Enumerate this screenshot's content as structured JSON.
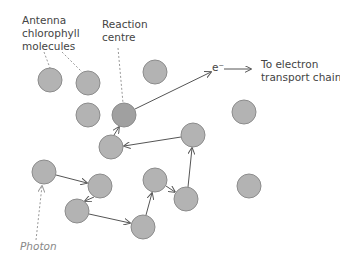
{
  "diagram": {
    "labels": {
      "antenna": "Antenna\nchlorophyll\nmolecules",
      "reaction_centre": "Reaction\ncentre",
      "electron": "e⁻",
      "destination": "To electron\ntransport chain",
      "photon": "Photon"
    },
    "colors": {
      "molecule_fill": "#b3b3b3",
      "reaction_centre_fill": "#a0a0a0",
      "molecule_stroke": "#8c8c8c",
      "arrow": "#555555",
      "dashed": "#999999",
      "text": "#444444"
    },
    "nodes": [
      {
        "id": "a1",
        "x": 50,
        "y": 80,
        "type": "antenna"
      },
      {
        "id": "a2",
        "x": 88,
        "y": 83,
        "type": "antenna"
      },
      {
        "id": "a3",
        "x": 155,
        "y": 72,
        "type": "antenna"
      },
      {
        "id": "a4",
        "x": 88,
        "y": 115,
        "type": "antenna"
      },
      {
        "id": "rc",
        "x": 124,
        "y": 115,
        "type": "reaction_centre"
      },
      {
        "id": "a5",
        "x": 244,
        "y": 112,
        "type": "antenna"
      },
      {
        "id": "a6",
        "x": 111,
        "y": 147,
        "type": "antenna"
      },
      {
        "id": "a7",
        "x": 193,
        "y": 135,
        "type": "antenna"
      },
      {
        "id": "a8",
        "x": 44,
        "y": 172,
        "type": "antenna"
      },
      {
        "id": "a9",
        "x": 100,
        "y": 186,
        "type": "antenna"
      },
      {
        "id": "a10",
        "x": 155,
        "y": 180,
        "type": "antenna"
      },
      {
        "id": "a11",
        "x": 77,
        "y": 211,
        "type": "antenna"
      },
      {
        "id": "a12",
        "x": 186,
        "y": 199,
        "type": "antenna"
      },
      {
        "id": "a13",
        "x": 143,
        "y": 227,
        "type": "antenna"
      },
      {
        "id": "a14",
        "x": 249,
        "y": 186,
        "type": "antenna"
      }
    ],
    "energy_path": [
      "a8",
      "a9",
      "a11",
      "a13",
      "a10",
      "a12",
      "a7",
      "a6",
      "rc"
    ]
  }
}
